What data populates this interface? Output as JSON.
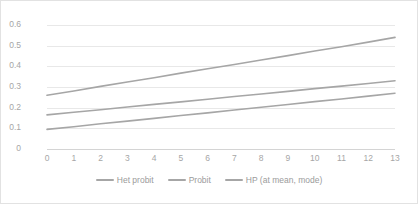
{
  "chart_data": {
    "type": "line",
    "title": "",
    "subtitle": "",
    "xlabel": "",
    "ylabel": "",
    "x": [
      0,
      1,
      2,
      3,
      4,
      5,
      6,
      7,
      8,
      9,
      10,
      11,
      12,
      13
    ],
    "xlim": [
      0,
      13
    ],
    "ylim": [
      0,
      0.6
    ],
    "grid": "horizontal",
    "legend_position": "bottom-center",
    "x_tick_labels": [
      "0",
      "1",
      "2",
      "3",
      "4",
      "5",
      "6",
      "7",
      "8",
      "9",
      "10",
      "11",
      "12",
      "13"
    ],
    "y_tick_labels": [
      "0",
      "0.1",
      "0.2",
      "0.3",
      "0.4",
      "0.5",
      "0.6"
    ],
    "y_tick_values": [
      0,
      0.1,
      0.2,
      0.3,
      0.4,
      0.5,
      0.6
    ],
    "series": [
      {
        "name": "Het probit",
        "color": "#a6a6a6",
        "values": [
          0.26,
          0.281,
          0.303,
          0.324,
          0.345,
          0.367,
          0.388,
          0.409,
          0.431,
          0.452,
          0.474,
          0.495,
          0.517,
          0.54
        ]
      },
      {
        "name": "Probit",
        "color": "#a6a6a6",
        "values": [
          0.165,
          0.178,
          0.19,
          0.203,
          0.216,
          0.228,
          0.241,
          0.254,
          0.266,
          0.279,
          0.292,
          0.304,
          0.317,
          0.33
        ]
      },
      {
        "name": "HP (at mean, mode)",
        "color": "#a6a6a6",
        "values": [
          0.095,
          0.108,
          0.122,
          0.135,
          0.148,
          0.162,
          0.175,
          0.189,
          0.202,
          0.215,
          0.229,
          0.242,
          0.256,
          0.27
        ]
      }
    ]
  },
  "style": {
    "plot_background": "#ffffff",
    "frame_border": "#e2e2e2",
    "gridline_color": "#e8e8e8",
    "tick_label_color": "#a6a6a6",
    "legend_label_color": "#9b9b9b"
  }
}
